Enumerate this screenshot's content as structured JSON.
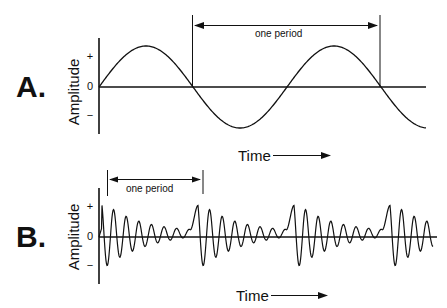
{
  "panels": [
    {
      "label": "A.",
      "ylabel": "Amplitude",
      "ticks": {
        "plus": "+",
        "zero": "0",
        "minus": "−"
      },
      "period_label": "one period",
      "xlabel": "Time",
      "description": "pure sine wave"
    },
    {
      "label": "B.",
      "ylabel": "Amplitude",
      "ticks": {
        "plus": "+",
        "zero": "0",
        "minus": "−"
      },
      "period_label": "one period",
      "xlabel": "Time",
      "description": "complex periodic waveform with decaying oscillations repeating each period"
    }
  ],
  "colors": {
    "ink": "#111111",
    "background": "#ffffff"
  }
}
